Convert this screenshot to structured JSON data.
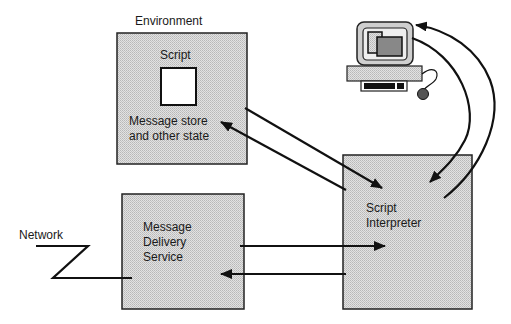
{
  "diagram": {
    "environment": {
      "title": "Environment",
      "script_label": "Script",
      "state_label": "Message store\nand other state"
    },
    "interpreter": {
      "label": "Script\nInterpreter"
    },
    "delivery": {
      "label": "Message\nDelivery\nService"
    },
    "network": {
      "label": "Network"
    },
    "workstation": {
      "icon": "computer-icon"
    },
    "colors": {
      "box_fill": "#d4d4d4",
      "stroke": "#111111",
      "background": "#ffffff"
    },
    "edges": [
      {
        "from": "environment",
        "to": "interpreter",
        "direction": "to-interpreter"
      },
      {
        "from": "interpreter",
        "to": "environment",
        "direction": "to-environment"
      },
      {
        "from": "delivery",
        "to": "interpreter",
        "direction": "to-interpreter"
      },
      {
        "from": "interpreter",
        "to": "delivery",
        "direction": "to-delivery"
      },
      {
        "from": "workstation",
        "to": "interpreter",
        "direction": "to-interpreter"
      },
      {
        "from": "interpreter",
        "to": "workstation",
        "direction": "to-workstation"
      },
      {
        "from": "network",
        "to": "delivery",
        "direction": "link"
      }
    ]
  }
}
